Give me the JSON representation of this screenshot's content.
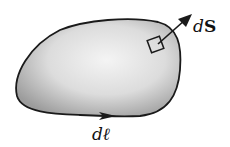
{
  "diagram": {
    "labels": {
      "surface_element": "d",
      "surface_element_vec": "S",
      "line_element": "d",
      "line_element_vec": "ℓ"
    },
    "colors": {
      "outline": "#1a1a1a",
      "fill_light": "#f2f2f2",
      "fill_dark": "#9a9a9a",
      "background": "#ffffff"
    }
  }
}
